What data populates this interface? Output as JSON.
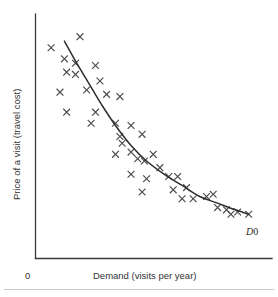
{
  "figure": {
    "origin_label": "0",
    "curve_label": "D0",
    "curve_label_italic_part": "D",
    "curve_label_plain_part": "0"
  },
  "axes": {
    "y_label": "Price of a visit (travel cost)",
    "x_label": "Demand (visits per year)"
  },
  "colors": {
    "axis": "#3a3a3a",
    "curve": "#2e2e2e",
    "marker": "#4a4a4a",
    "text": "#333333",
    "background": "#ffffff",
    "footer_rule": "#cccccc"
  },
  "chart_data": {
    "type": "scatter",
    "title": "",
    "subtitle": "",
    "xlabel": "Demand (visits per year)",
    "ylabel": "Price of a visit (travel cost)",
    "xlim": [
      0,
      100
    ],
    "ylim": [
      0,
      100
    ],
    "grid": false,
    "legend": "none",
    "annotations": [
      {
        "text": "D0",
        "x": 91,
        "y": 14,
        "note": "label at lower-right end of fitted demand curve"
      },
      {
        "text": "0",
        "x": 0,
        "y": 0,
        "note": "origin tick label below axis corner"
      }
    ],
    "axis_ticks": {
      "x": [],
      "y": []
    },
    "series": [
      {
        "name": "Observed visit price vs. visits",
        "type": "scatter",
        "marker": "x",
        "points": [
          {
            "x": 5,
            "y": 92
          },
          {
            "x": 18,
            "y": 97
          },
          {
            "x": 11,
            "y": 87
          },
          {
            "x": 16,
            "y": 85
          },
          {
            "x": 12,
            "y": 81
          },
          {
            "x": 16,
            "y": 80
          },
          {
            "x": 25,
            "y": 84
          },
          {
            "x": 9,
            "y": 72
          },
          {
            "x": 27,
            "y": 77
          },
          {
            "x": 21,
            "y": 73
          },
          {
            "x": 12,
            "y": 63
          },
          {
            "x": 30,
            "y": 71
          },
          {
            "x": 36,
            "y": 70
          },
          {
            "x": 25,
            "y": 63
          },
          {
            "x": 23,
            "y": 58
          },
          {
            "x": 34,
            "y": 58
          },
          {
            "x": 41,
            "y": 57
          },
          {
            "x": 36,
            "y": 52
          },
          {
            "x": 37,
            "y": 49
          },
          {
            "x": 46,
            "y": 53
          },
          {
            "x": 34,
            "y": 44
          },
          {
            "x": 41,
            "y": 45
          },
          {
            "x": 44,
            "y": 42
          },
          {
            "x": 47,
            "y": 41
          },
          {
            "x": 51,
            "y": 44
          },
          {
            "x": 41,
            "y": 35
          },
          {
            "x": 54,
            "y": 38
          },
          {
            "x": 48,
            "y": 33
          },
          {
            "x": 58,
            "y": 34
          },
          {
            "x": 62,
            "y": 34
          },
          {
            "x": 46,
            "y": 27
          },
          {
            "x": 60,
            "y": 28
          },
          {
            "x": 66,
            "y": 29
          },
          {
            "x": 64,
            "y": 24
          },
          {
            "x": 69,
            "y": 24
          },
          {
            "x": 75,
            "y": 25
          },
          {
            "x": 78,
            "y": 26
          },
          {
            "x": 80,
            "y": 20
          },
          {
            "x": 84,
            "y": 19
          },
          {
            "x": 86,
            "y": 17
          },
          {
            "x": 89,
            "y": 18
          },
          {
            "x": 94,
            "y": 17
          }
        ]
      },
      {
        "name": "D0",
        "type": "line",
        "label": "D0",
        "note": "smooth convex downward-sloping fitted demand curve",
        "points": [
          {
            "x": 11,
            "y": 95
          },
          {
            "x": 16,
            "y": 86
          },
          {
            "x": 22,
            "y": 76
          },
          {
            "x": 28,
            "y": 66
          },
          {
            "x": 34,
            "y": 57
          },
          {
            "x": 41,
            "y": 48
          },
          {
            "x": 48,
            "y": 41
          },
          {
            "x": 56,
            "y": 35
          },
          {
            "x": 64,
            "y": 30
          },
          {
            "x": 72,
            "y": 25
          },
          {
            "x": 80,
            "y": 22
          },
          {
            "x": 88,
            "y": 19
          },
          {
            "x": 94,
            "y": 17
          }
        ]
      }
    ]
  }
}
